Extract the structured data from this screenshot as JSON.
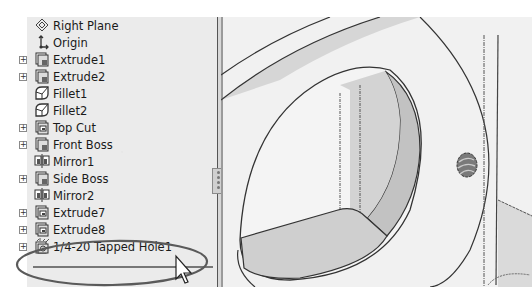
{
  "feature_tree": {
    "items": [
      {
        "label": "Right Plane",
        "icon": "plane-icon",
        "expandable": false
      },
      {
        "label": "Origin",
        "icon": "origin-icon",
        "expandable": false
      },
      {
        "label": "Extrude1",
        "icon": "extrude-icon",
        "expandable": true
      },
      {
        "label": "Extrude2",
        "icon": "extrude-icon",
        "expandable": true
      },
      {
        "label": "Fillet1",
        "icon": "fillet-icon",
        "expandable": false
      },
      {
        "label": "Fillet2",
        "icon": "fillet-icon",
        "expandable": false
      },
      {
        "label": "Top Cut",
        "icon": "cut-extrude-icon",
        "expandable": true
      },
      {
        "label": "Front Boss",
        "icon": "extrude-icon",
        "expandable": true
      },
      {
        "label": "Mirror1",
        "icon": "mirror-icon",
        "expandable": false
      },
      {
        "label": "Side Boss",
        "icon": "extrude-icon",
        "expandable": true
      },
      {
        "label": "Mirror2",
        "icon": "mirror-icon",
        "expandable": false
      },
      {
        "label": "Extrude7",
        "icon": "cut-extrude-icon",
        "expandable": true
      },
      {
        "label": "Extrude8",
        "icon": "cut-extrude-icon",
        "expandable": true
      },
      {
        "label": "1/4-20 Tapped Hole1",
        "icon": "hole-wizard-icon",
        "expandable": true,
        "highlighted": true
      }
    ]
  },
  "expander_symbol": "+",
  "annotation": {
    "shape": "ellipse",
    "color": "#555555",
    "target": "1/4-20 Tapped Hole1"
  },
  "viewport": {
    "content": "3D model view with circular cut face and tapped hole"
  },
  "colors": {
    "panel": "#ebebeb",
    "viewport": "#f1f1f1",
    "shaded_face": "#cfcfcf",
    "dark_face": "#b8b8b8",
    "edge": "#333333"
  }
}
